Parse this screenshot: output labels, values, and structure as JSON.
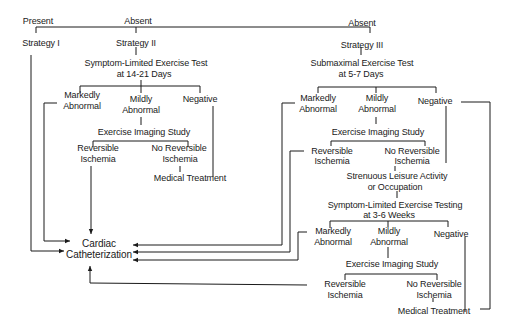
{
  "diagram": {
    "type": "flowchart",
    "top": {
      "present": "Present",
      "absent_left": "Absent",
      "absent_right": "Absent"
    },
    "strategies": {
      "s1": "Strategy I",
      "s2": "Strategy II",
      "s3": "Strategy III"
    },
    "strategy2": {
      "test_line1": "Symptom-Limited Exercise Test",
      "test_line2": "at 14-21 Days",
      "markedly_1": "Markedly",
      "markedly_2": "Abnormal",
      "mildly_1": "Mildly",
      "mildly_2": "Abnormal",
      "negative": "Negative",
      "imaging": "Exercise Imaging Study",
      "rev_1": "Reversible",
      "rev_2": "Ischemia",
      "norev_1": "No Reversible",
      "norev_2": "Ischemia",
      "medical": "Medical Treatment"
    },
    "strategy3": {
      "test_line1": "Submaximal Exercise Test",
      "test_line2": "at 5-7 Days",
      "markedly_1": "Markedly",
      "markedly_2": "Abnormal",
      "mildly_1": "Mildly",
      "mildly_2": "Abnormal",
      "negative": "Negative",
      "imaging": "Exercise Imaging Study",
      "rev_1": "Reversible",
      "rev_2": "Ischemia",
      "norev_1": "No Reversible",
      "norev_2": "Ischemia",
      "strenuous_1": "Strenuous Leisure Activity",
      "strenuous_2": "or Occupation",
      "test2_line1": "Symptom-Limited Exercise Testing",
      "test2_line2": "at 3-6 Weeks",
      "b_markedly_1": "Markedly",
      "b_markedly_2": "Abnormal",
      "b_mildly_1": "Mildly",
      "b_mildly_2": "Abnormal",
      "b_negative": "Negative",
      "b_imaging": "Exercise Imaging Study",
      "b_rev_1": "Reversible",
      "b_rev_2": "Ischemia",
      "b_norev_1": "No Reversible",
      "b_norev_2": "Ischemia",
      "b_medical": "Medical Treatment"
    },
    "cath": {
      "line1": "Cardiac",
      "line2": "Catheterization"
    },
    "colors": {
      "line": "#1a1a1a",
      "background": "#ffffff"
    }
  }
}
